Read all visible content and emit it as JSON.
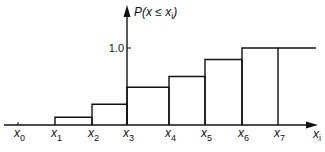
{
  "chart_data": {
    "type": "step",
    "title": "",
    "ylabel": "P(x ≤ xi)",
    "ylabel_parts": {
      "main": "P(x ≤ x",
      "sub": "i",
      "close": ")"
    },
    "xlabel": "xi",
    "xlabel_parts": {
      "main": "x",
      "sub": "i"
    },
    "x_ticks": [
      {
        "main": "x",
        "sub": "0"
      },
      {
        "main": "x",
        "sub": "1"
      },
      {
        "main": "x",
        "sub": "2"
      },
      {
        "main": "x",
        "sub": "3"
      },
      {
        "main": "x",
        "sub": "4"
      },
      {
        "main": "x",
        "sub": "5"
      },
      {
        "main": "x",
        "sub": "6"
      },
      {
        "main": "x",
        "sub": "7"
      }
    ],
    "y_ticks": [
      {
        "value": 1.0,
        "label": "1.0"
      }
    ],
    "ylim": [
      0,
      1.0
    ],
    "grid": false,
    "legend": null,
    "steps": [
      {
        "from": "x0",
        "to": "x1",
        "value": 0.0
      },
      {
        "from": "x1",
        "to": "x2",
        "value": 0.1
      },
      {
        "from": "x2",
        "to": "x3",
        "value": 0.27
      },
      {
        "from": "x3",
        "to": "x4",
        "value": 0.49
      },
      {
        "from": "x4",
        "to": "x5",
        "value": 0.63
      },
      {
        "from": "x5",
        "to": "x6",
        "value": 0.85
      },
      {
        "from": "x6",
        "to": "x7",
        "value": 1.0
      },
      {
        "from": "x7",
        "to": "end",
        "value": 1.0
      }
    ],
    "categories": [
      "x0",
      "x1",
      "x2",
      "x3",
      "x4",
      "x5",
      "x6",
      "x7"
    ],
    "values": [
      0.0,
      0.1,
      0.27,
      0.49,
      0.63,
      0.85,
      1.0,
      1.0
    ]
  }
}
